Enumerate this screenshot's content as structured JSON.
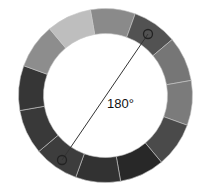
{
  "diagram": {
    "type": "color-wheel",
    "segment_count": 12,
    "segments": [
      {
        "index": 0,
        "start_deg": -10,
        "color": "#8a8a8a"
      },
      {
        "index": 1,
        "start_deg": 20,
        "color": "#525252"
      },
      {
        "index": 2,
        "start_deg": 50,
        "color": "#767676"
      },
      {
        "index": 3,
        "start_deg": 80,
        "color": "#7b7b7b"
      },
      {
        "index": 4,
        "start_deg": 110,
        "color": "#4a4a4a"
      },
      {
        "index": 5,
        "start_deg": 140,
        "color": "#282828"
      },
      {
        "index": 6,
        "start_deg": 170,
        "color": "#323232"
      },
      {
        "index": 7,
        "start_deg": 200,
        "color": "#3d3d3d"
      },
      {
        "index": 8,
        "start_deg": 230,
        "color": "#393939"
      },
      {
        "index": 9,
        "start_deg": 260,
        "color": "#363636"
      },
      {
        "index": 10,
        "start_deg": 290,
        "color": "#8d8d8d"
      },
      {
        "index": 11,
        "start_deg": 320,
        "color": "#bebebe"
      }
    ],
    "markers": [
      {
        "name": "marker-a",
        "segment": 1
      },
      {
        "name": "marker-b",
        "segment": 7
      }
    ],
    "angle_label": "180°"
  }
}
